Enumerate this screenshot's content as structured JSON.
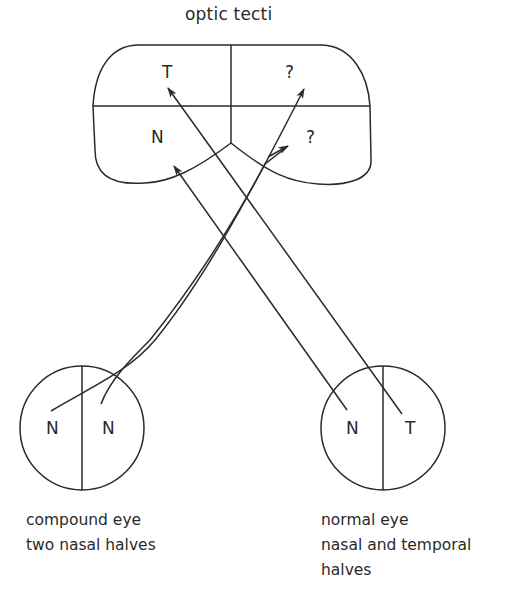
{
  "title": "optic tecti",
  "tectum": {
    "left_upper_label": "T",
    "left_lower_label": "N",
    "right_upper_label": "?",
    "right_lower_label": "?"
  },
  "left_eye": {
    "left_half_label": "N",
    "right_half_label": "N",
    "caption_line1": "compound eye",
    "caption_line2": "two nasal halves"
  },
  "right_eye": {
    "left_half_label": "N",
    "right_half_label": "T",
    "caption_line1": "normal eye",
    "caption_line2": "nasal and temporal",
    "caption_line3": "halves"
  },
  "colors": {
    "stroke": "#2a2a2a",
    "background": "#ffffff"
  }
}
